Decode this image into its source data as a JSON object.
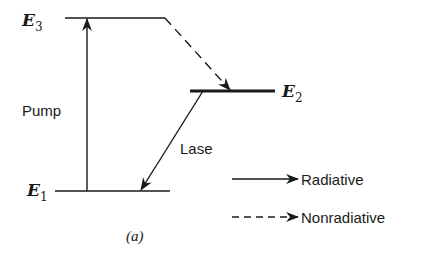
{
  "diagram": {
    "type": "energy-level-diagram",
    "caption": "(a)",
    "levels": [
      {
        "id": "E3",
        "label": "E",
        "subscript": "3",
        "y": 18,
        "x1": 65,
        "x2": 165
      },
      {
        "id": "E2",
        "label": "E",
        "subscript": "2",
        "y": 91,
        "x1": 190,
        "x2": 275
      },
      {
        "id": "E1",
        "label": "E",
        "subscript": "1",
        "y": 191,
        "x1": 55,
        "x2": 170
      }
    ],
    "transitions": [
      {
        "id": "pump",
        "label": "Pump",
        "from": "E1",
        "to": "E3",
        "style": "solid",
        "kind": "Radiative"
      },
      {
        "id": "nonradiative-decay",
        "label": "",
        "from": "E3",
        "to": "E2",
        "style": "dashed",
        "kind": "Nonradiative"
      },
      {
        "id": "lase",
        "label": "Lase",
        "from": "E2",
        "to": "E1",
        "style": "solid",
        "kind": "Radiative"
      }
    ],
    "legend": [
      {
        "style": "solid",
        "label": "Radiative"
      },
      {
        "style": "dashed",
        "label": "Nonradiative"
      }
    ],
    "colors": {
      "ink": "#1a1a1a",
      "background": "#ffffff"
    }
  }
}
